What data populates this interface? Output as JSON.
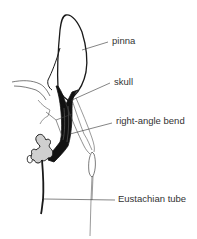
{
  "diagram": {
    "labels": {
      "pinna": "pinna",
      "skull": "skull",
      "bend": "right-angle bend",
      "eustachian": "Eustachian tube"
    },
    "colors": {
      "ink": "#1a1a1a",
      "canal_fill": "#111111",
      "tympanic_fill": "#cfcfcf",
      "text": "#333333",
      "background": "#ffffff"
    }
  }
}
